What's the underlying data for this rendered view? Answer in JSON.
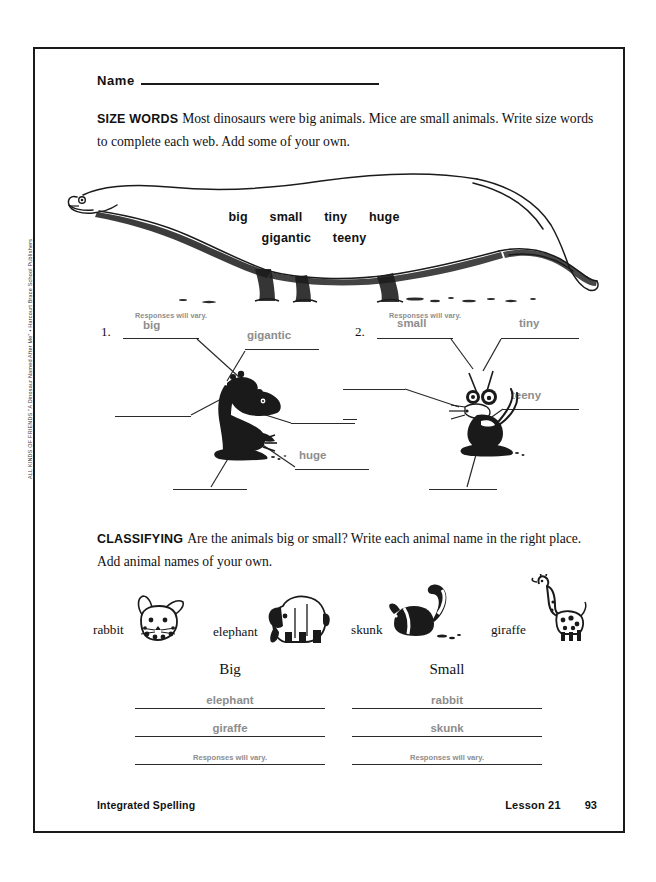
{
  "page": {
    "vertical_credit": "ALL KINDS OF FRIENDS \"A Dinosaur Named After Me\" • Harcourt Brace School Publishers"
  },
  "name_row": {
    "label": "Name"
  },
  "size_words": {
    "heading": "SIZE WORDS",
    "instructions": "Most dinosaurs were big animals. Mice are small animals. Write size words to complete each web. Add some of your own.",
    "word_bank_row_1": [
      "big",
      "small",
      "tiny",
      "huge"
    ],
    "word_bank_row_2": [
      "gigantic",
      "teeny"
    ]
  },
  "webs": [
    {
      "number": "1.",
      "vary_note": "Responses will vary.",
      "center_art": "dinosaur-illustration",
      "answers": {
        "top_left": "big",
        "top_right": "gigantic",
        "left": "",
        "right": "",
        "bottom_right": "huge",
        "bottom": ""
      }
    },
    {
      "number": "2.",
      "vary_note": "Responses will vary.",
      "center_art": "mouse-illustration",
      "answers": {
        "top_left": "small",
        "top_right": "tiny",
        "left": "",
        "right": "teeny",
        "bottom_right": "",
        "bottom": ""
      }
    }
  ],
  "classifying": {
    "heading": "CLASSIFYING",
    "instructions": "Are the animals big or small? Write each animal name in the right place. Add animal names of your own.",
    "animals": [
      {
        "name": "rabbit",
        "art": "rabbit-illustration"
      },
      {
        "name": "elephant",
        "art": "elephant-illustration"
      },
      {
        "name": "skunk",
        "art": "skunk-illustration"
      },
      {
        "name": "giraffe",
        "art": "giraffe-illustration"
      }
    ],
    "columns": [
      {
        "title": "Big",
        "entries": [
          "elephant",
          "giraffe",
          "Responses will vary."
        ]
      },
      {
        "title": "Small",
        "entries": [
          "rabbit",
          "skunk",
          "Responses will vary."
        ]
      }
    ]
  },
  "footer": {
    "left": "Integrated Spelling",
    "lesson": "Lesson 21",
    "page_number": "93"
  },
  "colors": {
    "ink": "#111111",
    "answer_gray": "#8d8d8d",
    "rule": "#2a2a2a"
  }
}
